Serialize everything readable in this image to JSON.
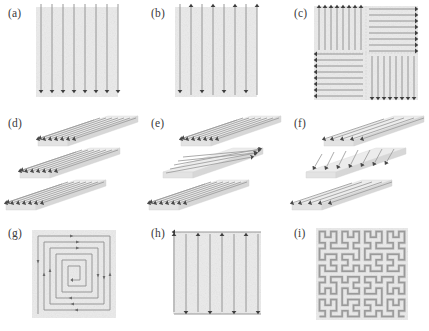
{
  "figure": {
    "columns": 3,
    "rows": 3,
    "background_color": "#ffffff",
    "substrate_color": "#ebebeb",
    "line_color": "#8d8d8d",
    "arrow_color": "#4d4d4d",
    "slab_color": "#ececec"
  },
  "panels": [
    {
      "label": "(a)",
      "name": "unidirectional-vertical-scan",
      "pattern": "unidirectional",
      "orientation": "vertical",
      "direction": "all arrows point down",
      "line_count": 8
    },
    {
      "label": "(b)",
      "name": "bidirectional-vertical-scan",
      "pattern": "bidirectional alternating",
      "orientation": "vertical",
      "direction": "arrows alternate up and down",
      "line_count": 8
    },
    {
      "label": "(c)",
      "name": "quadrant-sector-scan",
      "pattern": "island / quadrant sectors",
      "orientation": "mixed",
      "direction": "top-left up, top-right right, bottom-left left, bottom-right down",
      "quadrants": 4,
      "lines_per_quadrant": 8
    },
    {
      "label": "(d)",
      "name": "layered-constant-angle-scan",
      "pattern": "stacked layers, constant angle",
      "orientation": "diagonal",
      "direction": "all layers scan down-left at the same angle",
      "layer_count": 3,
      "lines_per_layer": 8
    },
    {
      "label": "(e)",
      "name": "layered-alternating-ninety-degree-scan",
      "pattern": "stacked layers, 90 degree alternation",
      "orientation": "diagonal and horizontal alternating",
      "direction": "outer layers diagonal, middle layer horizontal",
      "layer_count": 3,
      "lines_per_layer": 8
    },
    {
      "label": "(f)",
      "name": "layered-rotating-angle-scan",
      "pattern": "stacked layers, incremental rotation",
      "orientation": "rotating diagonal",
      "direction": "each layer rotated by an increment relative to the one below",
      "layer_count": 3,
      "lines_per_layer": 6
    },
    {
      "label": "(g)",
      "name": "square-spiral-scan",
      "pattern": "inward square spiral",
      "orientation": "concentric",
      "direction": "outside inward, counter-clockwise",
      "turn_count": 4
    },
    {
      "label": "(h)",
      "name": "serpentine-connected-scan",
      "pattern": "continuous serpentine with connecting passes",
      "orientation": "vertical",
      "direction": "alternating up and down joined by horizontal links at top and bottom",
      "line_count": 7
    },
    {
      "label": "(i)",
      "name": "hilbert-curve-scan",
      "pattern": "Hilbert space-filling curve",
      "orientation": "fractal",
      "direction": "continuous single path",
      "order": 4
    }
  ]
}
